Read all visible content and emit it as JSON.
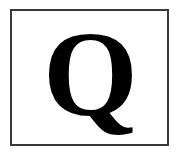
{
  "card": {
    "letter": "Q",
    "border_color": "#3a3a3a",
    "letter_color": "#000000",
    "background": "#ffffff"
  }
}
